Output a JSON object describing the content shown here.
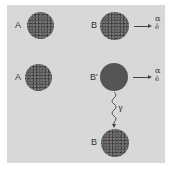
{
  "diagram": {
    "title": "",
    "rows": [
      {
        "left": {
          "label": "A"
        },
        "right": {
          "label": "B",
          "emissions": [
            "α",
            "ē"
          ]
        }
      },
      {
        "left": {
          "label": "A"
        },
        "right": {
          "label": "B'",
          "emissions": [
            "α",
            "ē"
          ]
        },
        "decay": {
          "symbol": "γ",
          "product_label": "B"
        }
      }
    ],
    "colors": {
      "background": "#d8d8d8",
      "nucleus": "#5a5a5a",
      "text": "#333333"
    }
  }
}
